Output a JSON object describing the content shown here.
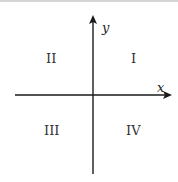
{
  "diagram": {
    "axes": {
      "x_label": "x",
      "y_label": "y"
    },
    "quadrants": [
      {
        "label": "I",
        "position": "upper-right"
      },
      {
        "label": "II",
        "position": "upper-left"
      },
      {
        "label": "III",
        "position": "lower-left"
      },
      {
        "label": "IV",
        "position": "lower-right"
      }
    ],
    "colors": {
      "axis": "#1a1a1a",
      "text": "#333333"
    }
  }
}
